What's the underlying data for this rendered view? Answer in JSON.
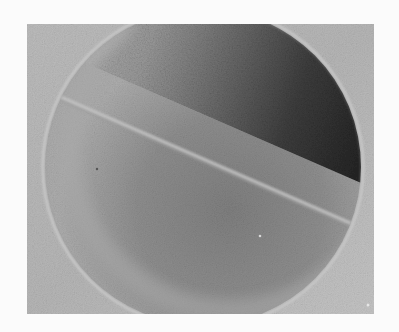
{
  "image": {
    "type": "grayscale photograph",
    "subject": "circular disc divided by a diagonal boundary line",
    "frame": {
      "x": 27,
      "y": 24,
      "width": 347,
      "height": 290
    },
    "disc": {
      "cx": 203,
      "cy": 167,
      "r": 158
    },
    "boundary_line": {
      "x1": 63,
      "y1": 98,
      "x2": 348,
      "y2": 222
    },
    "colors": {
      "page_background": "#fbfbfb",
      "frame_background": "#b8b8b8",
      "frame_background_light": "#c6c6c6",
      "upper_region_light": "#a9a9a9",
      "upper_region_mid": "#6e6e6e",
      "upper_region_dark": "#2e2e2e",
      "boundary_highlight": "#c2c2c2",
      "lower_region_light": "#a6a6a6",
      "lower_region_mid": "#8c8c8c",
      "lower_region_dark": "#7a7a7a",
      "outer_halo": "#bdbdbd"
    },
    "notes": "No visible text in the image."
  }
}
